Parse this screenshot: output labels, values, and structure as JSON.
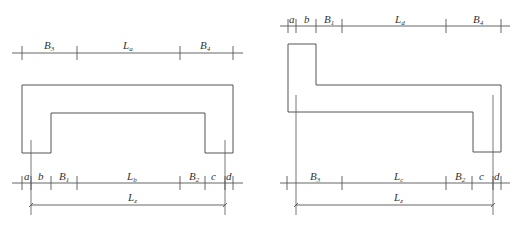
{
  "figures": [
    {
      "id": "left",
      "description": "Cross-section with two downward legs (channel shape), hatched",
      "top_dimensions": [
        {
          "label": "B",
          "sub": "3"
        },
        {
          "label": "L",
          "sub": "a"
        },
        {
          "label": "B",
          "sub": "4"
        }
      ],
      "bottom_dimensions": [
        {
          "label": "a",
          "sub": ""
        },
        {
          "label": "b",
          "sub": ""
        },
        {
          "label": "B",
          "sub": "1"
        },
        {
          "label": "L",
          "sub": "b"
        },
        {
          "label": "B",
          "sub": "2"
        },
        {
          "label": "c",
          "sub": ""
        },
        {
          "label": "d",
          "sub": ""
        }
      ],
      "overall_dimension": {
        "label": "L",
        "sub": "z"
      }
    },
    {
      "id": "right",
      "description": "Cross-section with upward leg on left and downward leg on right (Z shape), hatched",
      "top_dimensions": [
        {
          "label": "a",
          "sub": ""
        },
        {
          "label": "b",
          "sub": ""
        },
        {
          "label": "B",
          "sub": "1"
        },
        {
          "label": "L",
          "sub": "d"
        },
        {
          "label": "B",
          "sub": "4"
        }
      ],
      "bottom_dimensions": [
        {
          "label": "B",
          "sub": "3"
        },
        {
          "label": "L",
          "sub": "c"
        },
        {
          "label": "B",
          "sub": "2"
        },
        {
          "label": "c",
          "sub": ""
        },
        {
          "label": "d",
          "sub": ""
        }
      ],
      "overall_dimension": {
        "label": "L",
        "sub": "z"
      }
    }
  ],
  "colors": {
    "line": "#555555",
    "text": "#333333",
    "background": "#ffffff"
  }
}
